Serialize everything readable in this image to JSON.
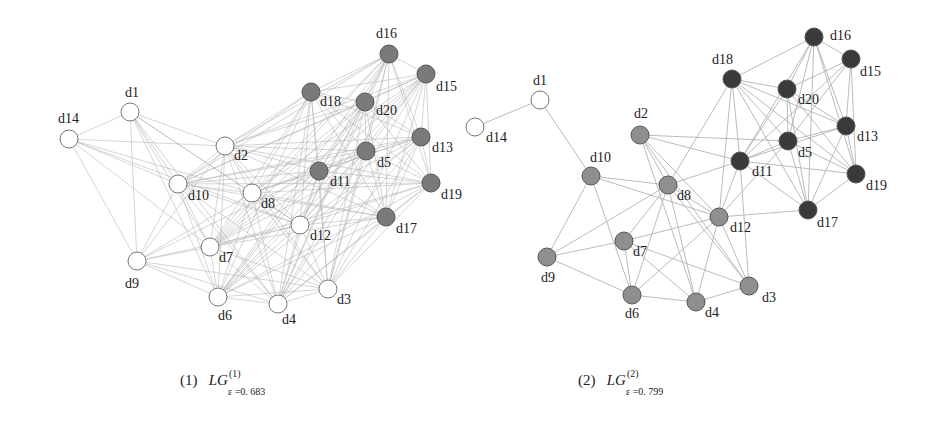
{
  "figure": {
    "panels": [
      {
        "id": "panel1",
        "caption": {
          "index": "(1)",
          "symbol": "LG",
          "superscript": "(1)",
          "subscript": "ε =0. 683"
        },
        "nodes": [
          {
            "id": "d1",
            "x": 130,
            "y": 112,
            "fill": "#ffffff",
            "lx": 125,
            "ly": 97
          },
          {
            "id": "d2",
            "x": 225,
            "y": 146,
            "fill": "#ffffff",
            "lx": 234,
            "ly": 160
          },
          {
            "id": "d3",
            "x": 328,
            "y": 289,
            "fill": "#ffffff",
            "lx": 337,
            "ly": 304
          },
          {
            "id": "d4",
            "x": 278,
            "y": 304,
            "fill": "#ffffff",
            "lx": 282,
            "ly": 324
          },
          {
            "id": "d5",
            "x": 366,
            "y": 151,
            "fill": "#7a7a7a",
            "lx": 377,
            "ly": 167
          },
          {
            "id": "d6",
            "x": 218,
            "y": 297,
            "fill": "#ffffff",
            "lx": 218,
            "ly": 320
          },
          {
            "id": "d7",
            "x": 210,
            "y": 247,
            "fill": "#ffffff",
            "lx": 219,
            "ly": 262
          },
          {
            "id": "d8",
            "x": 252,
            "y": 193,
            "fill": "#ffffff",
            "lx": 261,
            "ly": 208
          },
          {
            "id": "d9",
            "x": 137,
            "y": 261,
            "fill": "#ffffff",
            "lx": 125,
            "ly": 288
          },
          {
            "id": "d10",
            "x": 178,
            "y": 184,
            "fill": "#ffffff",
            "lx": 188,
            "ly": 200
          },
          {
            "id": "d11",
            "x": 319,
            "y": 171,
            "fill": "#7a7a7a",
            "lx": 330,
            "ly": 186
          },
          {
            "id": "d12",
            "x": 300,
            "y": 225,
            "fill": "#ffffff",
            "lx": 310,
            "ly": 240
          },
          {
            "id": "d13",
            "x": 421,
            "y": 137,
            "fill": "#7a7a7a",
            "lx": 432,
            "ly": 152
          },
          {
            "id": "d14",
            "x": 69,
            "y": 139,
            "fill": "#ffffff",
            "lx": 58,
            "ly": 123
          },
          {
            "id": "d15",
            "x": 426,
            "y": 74,
            "fill": "#7a7a7a",
            "lx": 436,
            "ly": 91
          },
          {
            "id": "d16",
            "x": 389,
            "y": 54,
            "fill": "#7a7a7a",
            "lx": 376,
            "ly": 38
          },
          {
            "id": "d17",
            "x": 386,
            "y": 217,
            "fill": "#7a7a7a",
            "lx": 396,
            "ly": 233
          },
          {
            "id": "d18",
            "x": 311,
            "y": 92,
            "fill": "#7a7a7a",
            "lx": 320,
            "ly": 106
          },
          {
            "id": "d19",
            "x": 431,
            "y": 183,
            "fill": "#7a7a7a",
            "lx": 441,
            "ly": 199
          },
          {
            "id": "d20",
            "x": 365,
            "y": 102,
            "fill": "#7a7a7a",
            "lx": 376,
            "ly": 115
          }
        ]
      },
      {
        "id": "panel2",
        "caption": {
          "index": "(2)",
          "symbol": "LG",
          "superscript": "(2)",
          "subscript": "ε =0. 799"
        },
        "nodes": [
          {
            "id": "d1",
            "x": 540,
            "y": 100,
            "fill": "#ffffff",
            "lx": 533,
            "ly": 85
          },
          {
            "id": "d2",
            "x": 640,
            "y": 135,
            "fill": "#8f8f8f",
            "lx": 634,
            "ly": 118
          },
          {
            "id": "d3",
            "x": 749,
            "y": 286,
            "fill": "#8f8f8f",
            "lx": 762,
            "ly": 302
          },
          {
            "id": "d4",
            "x": 696,
            "y": 302,
            "fill": "#8f8f8f",
            "lx": 705,
            "ly": 317
          },
          {
            "id": "d5",
            "x": 788,
            "y": 141,
            "fill": "#3a3a3a",
            "lx": 798,
            "ly": 157
          },
          {
            "id": "d6",
            "x": 632,
            "y": 295,
            "fill": "#8f8f8f",
            "lx": 625,
            "ly": 318
          },
          {
            "id": "d7",
            "x": 624,
            "y": 241,
            "fill": "#8f8f8f",
            "lx": 633,
            "ly": 256
          },
          {
            "id": "d8",
            "x": 668,
            "y": 185,
            "fill": "#8f8f8f",
            "lx": 677,
            "ly": 200
          },
          {
            "id": "d9",
            "x": 547,
            "y": 257,
            "fill": "#8f8f8f",
            "lx": 541,
            "ly": 282
          },
          {
            "id": "d10",
            "x": 591,
            "y": 176,
            "fill": "#8f8f8f",
            "lx": 590,
            "ly": 162
          },
          {
            "id": "d11",
            "x": 740,
            "y": 161,
            "fill": "#3a3a3a",
            "lx": 752,
            "ly": 176
          },
          {
            "id": "d12",
            "x": 719,
            "y": 217,
            "fill": "#8f8f8f",
            "lx": 730,
            "ly": 232
          },
          {
            "id": "d13",
            "x": 846,
            "y": 126,
            "fill": "#3a3a3a",
            "lx": 857,
            "ly": 141
          },
          {
            "id": "d14",
            "x": 475,
            "y": 127,
            "fill": "#ffffff",
            "lx": 486,
            "ly": 142
          },
          {
            "id": "d15",
            "x": 851,
            "y": 59,
            "fill": "#3a3a3a",
            "lx": 860,
            "ly": 76
          },
          {
            "id": "d16",
            "x": 814,
            "y": 37,
            "fill": "#3a3a3a",
            "lx": 830,
            "ly": 40
          },
          {
            "id": "d17",
            "x": 808,
            "y": 210,
            "fill": "#3a3a3a",
            "lx": 817,
            "ly": 227
          },
          {
            "id": "d18",
            "x": 732,
            "y": 79,
            "fill": "#3a3a3a",
            "lx": 712,
            "ly": 64
          },
          {
            "id": "d19",
            "x": 856,
            "y": 174,
            "fill": "#3a3a3a",
            "lx": 866,
            "ly": 190
          },
          {
            "id": "d20",
            "x": 787,
            "y": 89,
            "fill": "#3a3a3a",
            "lx": 798,
            "ly": 104
          }
        ],
        "edges": [
          [
            "d1",
            "d14"
          ],
          [
            "d1",
            "d10"
          ],
          [
            "d10",
            "d8"
          ],
          [
            "d10",
            "d9"
          ],
          [
            "d10",
            "d6"
          ],
          [
            "d10",
            "d12"
          ],
          [
            "d2",
            "d8"
          ],
          [
            "d2",
            "d11"
          ],
          [
            "d2",
            "d12"
          ],
          [
            "d2",
            "d5"
          ],
          [
            "d2",
            "d3"
          ],
          [
            "d2",
            "d4"
          ],
          [
            "d8",
            "d7"
          ],
          [
            "d8",
            "d9"
          ],
          [
            "d8",
            "d6"
          ],
          [
            "d8",
            "d4"
          ],
          [
            "d8",
            "d11"
          ],
          [
            "d8",
            "d18"
          ],
          [
            "d8",
            "d12"
          ],
          [
            "d8",
            "d3"
          ],
          [
            "d9",
            "d7"
          ],
          [
            "d9",
            "d6"
          ],
          [
            "d7",
            "d6"
          ],
          [
            "d7",
            "d12"
          ],
          [
            "d7",
            "d4"
          ],
          [
            "d7",
            "d3"
          ],
          [
            "d6",
            "d4"
          ],
          [
            "d6",
            "d12"
          ],
          [
            "d4",
            "d3"
          ],
          [
            "d4",
            "d12"
          ],
          [
            "d12",
            "d3"
          ],
          [
            "d12",
            "d11"
          ],
          [
            "d12",
            "d18"
          ],
          [
            "d12",
            "d17"
          ],
          [
            "d12",
            "d5"
          ],
          [
            "d11",
            "d3"
          ],
          [
            "d11",
            "d18"
          ],
          [
            "d11",
            "d20"
          ],
          [
            "d11",
            "d5"
          ],
          [
            "d11",
            "d13"
          ],
          [
            "d11",
            "d16"
          ],
          [
            "d11",
            "d19"
          ],
          [
            "d11",
            "d17"
          ],
          [
            "d11",
            "d15"
          ],
          [
            "d18",
            "d16"
          ],
          [
            "d18",
            "d20"
          ],
          [
            "d18",
            "d5"
          ],
          [
            "d18",
            "d13"
          ],
          [
            "d18",
            "d19"
          ],
          [
            "d18",
            "d17"
          ],
          [
            "d16",
            "d15"
          ],
          [
            "d16",
            "d20"
          ],
          [
            "d16",
            "d5"
          ],
          [
            "d16",
            "d13"
          ],
          [
            "d16",
            "d19"
          ],
          [
            "d16",
            "d17"
          ],
          [
            "d15",
            "d20"
          ],
          [
            "d15",
            "d13"
          ],
          [
            "d15",
            "d19"
          ],
          [
            "d15",
            "d5"
          ],
          [
            "d20",
            "d5"
          ],
          [
            "d20",
            "d13"
          ],
          [
            "d20",
            "d17"
          ],
          [
            "d20",
            "d19"
          ],
          [
            "d5",
            "d13"
          ],
          [
            "d5",
            "d17"
          ],
          [
            "d5",
            "d19"
          ],
          [
            "d13",
            "d19"
          ],
          [
            "d13",
            "d17"
          ],
          [
            "d19",
            "d17"
          ]
        ]
      }
    ],
    "legend_colors": {
      "white_group": "#ffffff",
      "mid_group_panel1": "#7a7a7a",
      "mid_group_panel2": "#8f8f8f",
      "dark_group_panel2": "#3a3a3a",
      "edge": "#b4b4b4"
    }
  }
}
